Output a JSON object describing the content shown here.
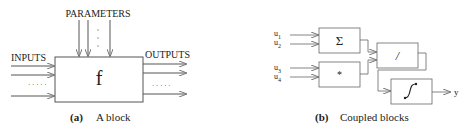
{
  "panel_a": {
    "parameters_label": "PARAMETERS",
    "inputs_label": "INPUTS",
    "outputs_label": "OUTPUTS",
    "block_symbol": "f",
    "ellipsis_vertical": "·\n·\n·",
    "ellipsis_horizontal": "· · · · ·",
    "caption_tag": "(a)",
    "caption_text": "A block"
  },
  "panel_b": {
    "inputs": [
      {
        "name": "u",
        "sub": "1"
      },
      {
        "name": "u",
        "sub": "2"
      },
      {
        "name": "u",
        "sub": "3"
      },
      {
        "name": "u",
        "sub": "4"
      }
    ],
    "blocks": {
      "sum": "Σ",
      "product": "*",
      "divide": "/",
      "integrate": "∫"
    },
    "output_label": "y",
    "caption_tag": "(b)",
    "caption_text": "Coupled blocks"
  },
  "colors": {
    "line": "#555555",
    "arrow": "#777777",
    "text": "#222222"
  }
}
